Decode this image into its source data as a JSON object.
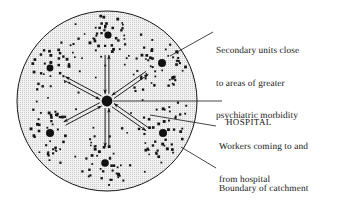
{
  "figure": {
    "type": "schematic-diagram",
    "background_color": "#ffffff",
    "ink_color": "#161616",
    "catchment_fill": "#efefef"
  },
  "labels": {
    "secondary_units": {
      "name": "secondary-units-label",
      "lines": [
        "Secondary units close",
        "to areas of greater",
        "psychiatric morbidity"
      ]
    },
    "hospital": {
      "name": "hospital-label",
      "lines": [
        "HOSPITAL"
      ]
    },
    "workers": {
      "name": "workers-label",
      "lines": [
        "Workers coming to and",
        "from hospital"
      ]
    },
    "boundary": {
      "name": "boundary-label",
      "lines": [
        "Boundary of catchment",
        "area"
      ]
    }
  },
  "diagram_data": {
    "catchment_circle": {
      "center_x": 107,
      "center_y": 101,
      "radius": 90,
      "stroke_color": "#161616",
      "fill_color": "#efefef",
      "stipple": true
    },
    "hospital_node": {
      "center_x": 107,
      "center_y": 101,
      "radius": 5.4,
      "color": "#111111"
    },
    "secondary_units": [
      {
        "id": "unit-top",
        "x": 108,
        "y": 35,
        "core_radius": 3.6,
        "dot_count": 34,
        "spread": 16
      },
      {
        "id": "unit-upper-right",
        "x": 162,
        "y": 63,
        "core_radius": 4.0,
        "dot_count": 48,
        "spread": 21
      },
      {
        "id": "unit-upper-left",
        "x": 50,
        "y": 68,
        "core_radius": 3.4,
        "dot_count": 26,
        "spread": 16
      },
      {
        "id": "unit-lower-left",
        "x": 50,
        "y": 133,
        "core_radius": 4.0,
        "dot_count": 36,
        "spread": 18
      },
      {
        "id": "unit-lower-right",
        "x": 163,
        "y": 133,
        "core_radius": 4.0,
        "dot_count": 38,
        "spread": 19
      },
      {
        "id": "unit-bottom",
        "x": 105,
        "y": 163,
        "core_radius": 3.8,
        "dot_count": 32,
        "spread": 16
      }
    ],
    "flow_arrows": [
      {
        "id": "flow-top",
        "angle_deg": -90,
        "length": 46
      },
      {
        "id": "flow-upper-right",
        "angle_deg": -35,
        "length": 49
      },
      {
        "id": "flow-upper-left",
        "angle_deg": -152,
        "length": 48
      },
      {
        "id": "flow-lower-left",
        "angle_deg": 152,
        "length": 48
      },
      {
        "id": "flow-lower-right",
        "angle_deg": 35,
        "length": 49
      },
      {
        "id": "flow-bottom",
        "angle_deg": 90,
        "length": 46
      }
    ],
    "leader_lines": [
      {
        "id": "leader-secondary-units",
        "x1": 170,
        "y1": 56,
        "x2": 213,
        "y2": 32
      },
      {
        "id": "leader-hospital",
        "x1": 113,
        "y1": 101,
        "x2": 222,
        "y2": 101
      },
      {
        "id": "leader-workers",
        "x1": 150,
        "y1": 115,
        "x2": 216,
        "y2": 126
      },
      {
        "id": "leader-boundary",
        "x1": 181,
        "y1": 147,
        "x2": 216,
        "y2": 168
      }
    ]
  }
}
